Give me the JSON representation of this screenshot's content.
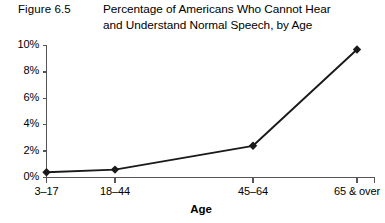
{
  "figure": {
    "label": "Figure 6.5",
    "title_line1": "Percentage of Americans Who Cannot Hear",
    "title_line2": "and Understand Normal Speech, by Age"
  },
  "colors": {
    "line": "#1a1a1a",
    "marker": "#1a1a1a",
    "axis": "#555555",
    "text": "#000000",
    "background": "#ffffff"
  },
  "chart_data": {
    "type": "line",
    "title": "Percentage of Americans Who Cannot Hear and Understand Normal Speech, by Age",
    "xlabel": "Age",
    "ylabel": "",
    "categories": [
      "3–17",
      "18–44",
      "45–64",
      "65 & over"
    ],
    "values": [
      0.4,
      0.6,
      2.4,
      9.7
    ],
    "ytick_labels": [
      "0%",
      "2%",
      "4%",
      "6%",
      "8%",
      "10%"
    ],
    "ytick_values": [
      0,
      2,
      4,
      6,
      8,
      10
    ],
    "ylim": [
      0,
      10
    ],
    "grid": false,
    "legend": false,
    "marker": "diamond"
  }
}
